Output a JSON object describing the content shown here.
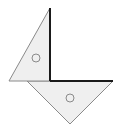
{
  "diagram": {
    "fill_color": "#efefef",
    "stroke_color": "#8a8a8a",
    "axis_color": "#1a1a1a",
    "upper_triangle": {
      "points": "50,8 50,81 9,81",
      "marker": {
        "cx": 36,
        "cy": 58,
        "r": 4
      }
    },
    "lower_triangle": {
      "points": "27,81 113,81 70,124",
      "marker": {
        "cx": 70,
        "cy": 98,
        "r": 4
      }
    },
    "right_angle_lines": {
      "vertical": {
        "x1": 50,
        "y1": 8,
        "x2": 50,
        "y2": 81
      },
      "horizontal": {
        "x1": 50,
        "y1": 81,
        "x2": 113,
        "y2": 81
      }
    }
  }
}
